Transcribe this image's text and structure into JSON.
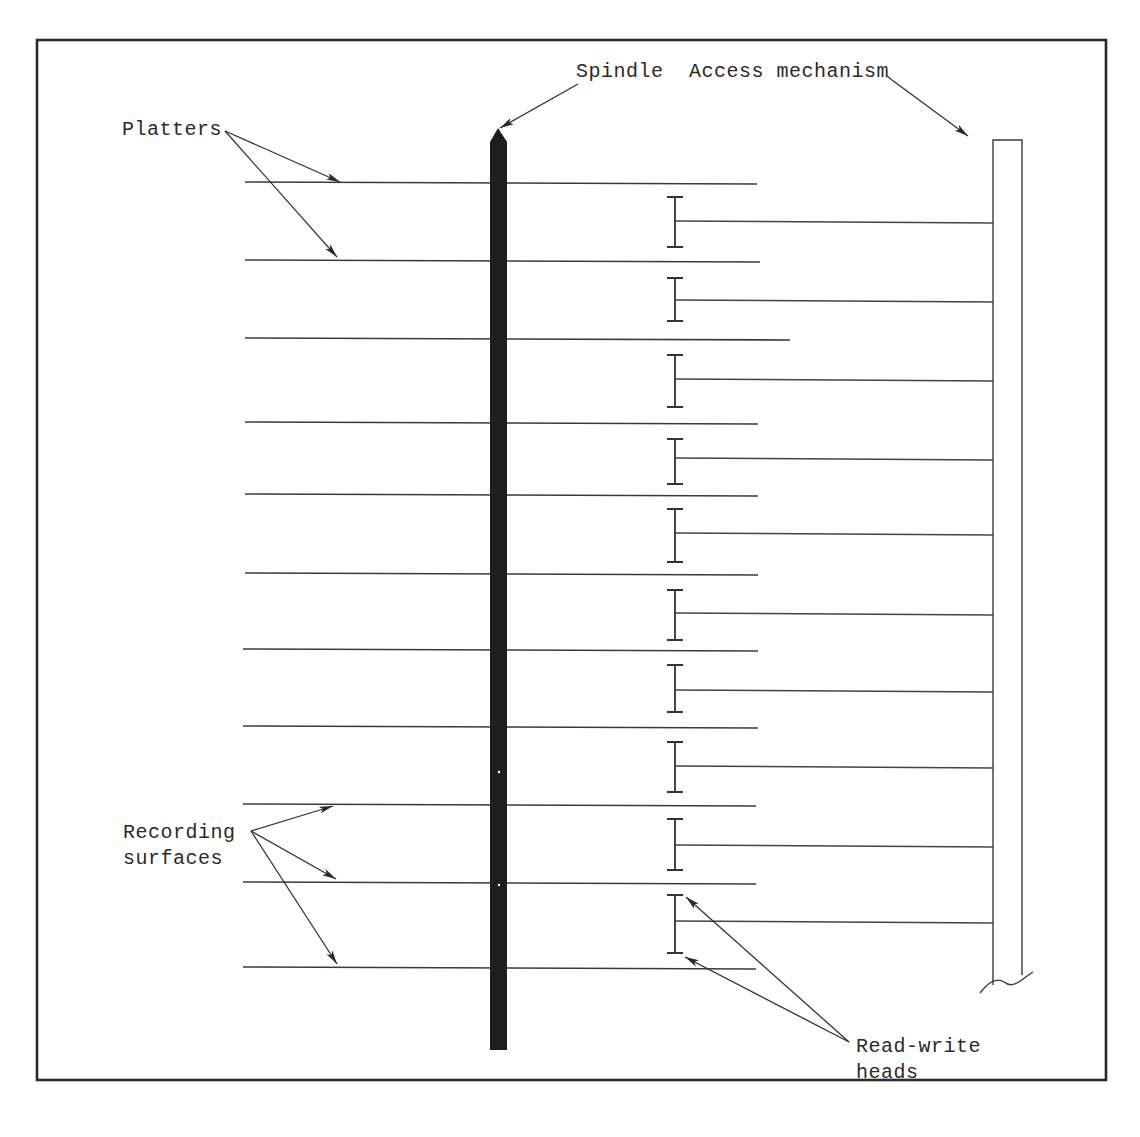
{
  "diagram": {
    "type": "disk-pack-schematic",
    "labels": {
      "spindle": "Spindle",
      "access_mechanism": "Access mechanism",
      "platters": "Platters",
      "recording_line1": "Recording",
      "recording_line2": "surfaces",
      "heads_line1": "Read-write",
      "heads_line2": "heads"
    },
    "frame": {
      "x1": 37,
      "y1": 40,
      "x2": 1106,
      "y2": 1080
    },
    "spindle": {
      "x": 490,
      "width": 17,
      "top": 130,
      "bottom": 1050,
      "color": "#1e1e1e"
    },
    "platters": [
      {
        "y": 182,
        "x1": 245,
        "x2": 757
      },
      {
        "y": 260,
        "x1": 245,
        "x2": 760
      },
      {
        "y": 338,
        "x1": 245,
        "x2": 790
      },
      {
        "y": 422,
        "x1": 245,
        "x2": 758
      },
      {
        "y": 494,
        "x1": 245,
        "x2": 758
      },
      {
        "y": 573,
        "x1": 245,
        "x2": 758
      },
      {
        "y": 649,
        "x1": 243,
        "x2": 758
      },
      {
        "y": 726,
        "x1": 243,
        "x2": 758
      },
      {
        "y": 804,
        "x1": 243,
        "x2": 756
      },
      {
        "y": 882,
        "x1": 243,
        "x2": 756
      },
      {
        "y": 967,
        "x1": 243,
        "x2": 756
      }
    ],
    "heads": [
      {
        "top": 197,
        "bottom": 247,
        "arm_y": 221
      },
      {
        "top": 278,
        "bottom": 321,
        "arm_y": 300
      },
      {
        "top": 355,
        "bottom": 407,
        "arm_y": 379
      },
      {
        "top": 439,
        "bottom": 484,
        "arm_y": 458
      },
      {
        "top": 509,
        "bottom": 562,
        "arm_y": 533
      },
      {
        "top": 590,
        "bottom": 640,
        "arm_y": 613
      },
      {
        "top": 665,
        "bottom": 712,
        "arm_y": 690
      },
      {
        "top": 742,
        "bottom": 792,
        "arm_y": 766
      },
      {
        "top": 819,
        "bottom": 870,
        "arm_y": 845
      },
      {
        "top": 895,
        "bottom": 953,
        "arm_y": 921
      }
    ],
    "head_x": 675,
    "head_cap_half_width": 8,
    "access_mechanism": {
      "x1": 993,
      "x2": 1022,
      "top": 140,
      "bottom": 985
    },
    "colors": {
      "ink": "#2a2a2a",
      "background": "#ffffff",
      "spindle_fill": "#1e1e1e"
    }
  }
}
